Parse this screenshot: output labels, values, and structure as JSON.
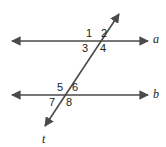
{
  "figure": {
    "stroke_color": "#4a4a4a",
    "text_color": "#1a1a1a",
    "background_color": "#ffffff"
  },
  "lines": {
    "parallel_upper": {
      "name": "line-a",
      "label": "a",
      "x1": 10,
      "y1": 41,
      "x2": 150,
      "y2": 41,
      "arrow_start": true,
      "arrow_end": true
    },
    "parallel_lower": {
      "name": "line-b",
      "label": "b",
      "x1": 10,
      "y1": 95,
      "x2": 150,
      "y2": 95,
      "arrow_start": true,
      "arrow_end": true
    },
    "transversal": {
      "name": "line-t",
      "label": "t",
      "x1": 43,
      "y1": 129,
      "x2": 121,
      "y2": 11,
      "arrow_start": true,
      "arrow_end": true
    }
  },
  "intersections": {
    "upper": {
      "x": 100,
      "y": 41
    },
    "lower": {
      "x": 66,
      "y": 95
    }
  },
  "angles": [
    {
      "id": "angle-1",
      "label": "1",
      "position": "upper-left-above"
    },
    {
      "id": "angle-2",
      "label": "2",
      "position": "upper-right-above"
    },
    {
      "id": "angle-3",
      "label": "3",
      "position": "upper-left-below"
    },
    {
      "id": "angle-4",
      "label": "4",
      "position": "upper-right-below"
    },
    {
      "id": "angle-5",
      "label": "5",
      "position": "lower-left-above"
    },
    {
      "id": "angle-6",
      "label": "6",
      "position": "lower-right-above"
    },
    {
      "id": "angle-7",
      "label": "7",
      "position": "lower-left-below"
    },
    {
      "id": "angle-8",
      "label": "8",
      "position": "lower-right-below"
    }
  ]
}
